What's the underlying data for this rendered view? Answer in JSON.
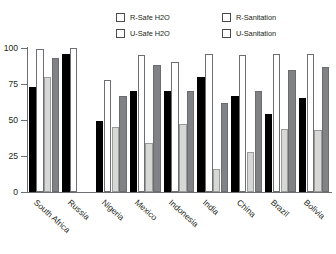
{
  "legend": {
    "items": [
      {
        "label": "R-Safe H2O",
        "key": "rsafe",
        "color": "#000000",
        "swatch_name": "legend-swatch-r-safe-h2o"
      },
      {
        "label": "U-Safe H2O",
        "key": "usafe",
        "color": "#ffffff",
        "swatch_name": "legend-swatch-u-safe-h2o"
      },
      {
        "label": "R-Sanitation",
        "key": "rsan",
        "color": "#d7d8d6",
        "swatch_name": "legend-swatch-r-sanitation"
      },
      {
        "label": "U-Sanitation",
        "key": "usan",
        "color": "#808285",
        "swatch_name": "legend-swatch-u-sanitation"
      }
    ]
  },
  "yaxis": {
    "ticks": [
      "100",
      "75",
      "50",
      "25",
      "0"
    ],
    "values": [
      100,
      75,
      50,
      25,
      0
    ]
  },
  "chart_data": {
    "type": "bar",
    "title": "",
    "subtitle": "",
    "xlabel": "",
    "ylabel": "",
    "ylim": [
      0,
      100
    ],
    "yticks": [
      0,
      25,
      50,
      75,
      100
    ],
    "grid": false,
    "legend_position": "top",
    "categories": [
      "South Africa",
      "Russia",
      "Nigeria",
      "Mexico",
      "Indonesia",
      "India",
      "China",
      "Brazil",
      "Bolivia"
    ],
    "series": [
      {
        "name": "R-Safe H2O",
        "color": "#000000",
        "values": [
          73,
          96,
          49,
          70,
          70,
          80,
          67,
          54,
          65
        ]
      },
      {
        "name": "U-Safe H2O",
        "color": "#ffffff",
        "values": [
          99,
          100,
          78,
          95,
          90,
          96,
          95,
          96,
          96
        ]
      },
      {
        "name": "R-Sanitation",
        "color": "#d7d8d6",
        "values": [
          80,
          null,
          45,
          34,
          47,
          16,
          28,
          44,
          43
        ]
      },
      {
        "name": "U-Sanitation",
        "color": "#808285",
        "values": [
          93,
          null,
          67,
          88,
          70,
          62,
          70,
          85,
          87
        ]
      }
    ]
  }
}
